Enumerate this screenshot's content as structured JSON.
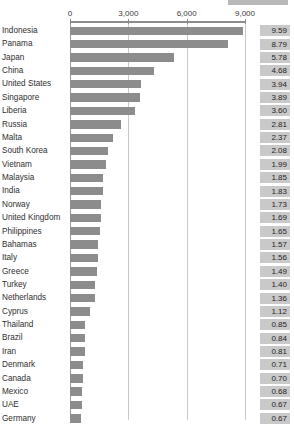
{
  "chart_data": {
    "type": "bar",
    "title": "",
    "xlabel": "",
    "ylabel": "",
    "orientation": "horizontal",
    "xlim": [
      0,
      9600
    ],
    "xticks": [
      0,
      3000,
      6000,
      9000
    ],
    "xtick_labels": [
      "0",
      "3,000",
      "6,000",
      "9,000"
    ],
    "grid": true,
    "legend": "none",
    "value_label_column": true,
    "categories": [
      "Indonesia",
      "Panama",
      "Japan",
      "China",
      "United States",
      "Singapore",
      "Liberia",
      "Russia",
      "Malta",
      "South Korea",
      "Vietnam",
      "Malaysia",
      "India",
      "Norway",
      "United Kingdom",
      "Philippines",
      "Bahamas",
      "Italy",
      "Greece",
      "Turkey",
      "Netherlands",
      "Cyprus",
      "Thailand",
      "Brazil",
      "Iran",
      "Denmark",
      "Canada",
      "Mexico",
      "UAE",
      "Germany"
    ],
    "values": [
      8900,
      8150,
      5360,
      4340,
      3660,
      3610,
      3340,
      2610,
      2200,
      1930,
      1850,
      1720,
      1700,
      1610,
      1570,
      1530,
      1460,
      1450,
      1390,
      1300,
      1260,
      1040,
      790,
      780,
      750,
      660,
      650,
      630,
      620,
      560
    ],
    "value_labels": [
      "9.59",
      "8.79",
      "5.78",
      "4.68",
      "3.94",
      "3.89",
      "3.60",
      "2.81",
      "2.37",
      "2.08",
      "1.99",
      "1.85",
      "1.83",
      "1.73",
      "1.69",
      "1.65",
      "1.57",
      "1.56",
      "1.49",
      "1.40",
      "1.36",
      "1.12",
      "0.85",
      "0.84",
      "0.81",
      "0.71",
      "0.70",
      "0.68",
      "0.67",
      "0.67"
    ],
    "colors": {
      "bar": "#8c8c8c",
      "value_box": "#c9c9c9",
      "gridline": "#c8c8c8",
      "axis": "#8c8c8c",
      "text": "#2f2f2f",
      "background": "#ffffff",
      "top_band": "#b9b9b9"
    }
  }
}
